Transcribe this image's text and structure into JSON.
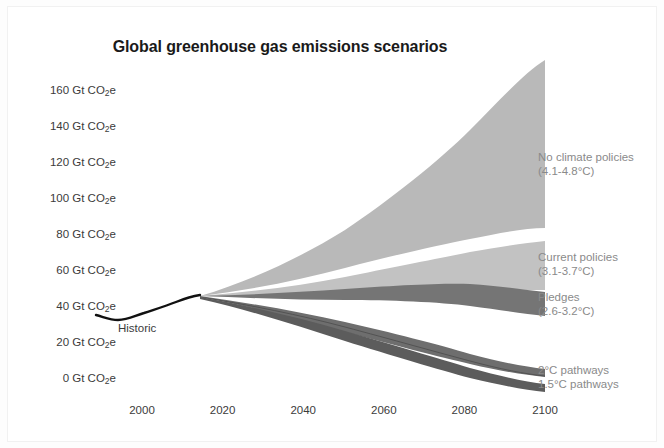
{
  "chart_data": {
    "type": "area",
    "title": "Global greenhouse gas emissions scenarios",
    "xlabel": "",
    "ylabel": "Gt CO2e",
    "xlim": [
      1990,
      2100
    ],
    "ylim": [
      -10,
      170
    ],
    "grid": false,
    "legend_position": "right-inline",
    "y_ticks": [
      {
        "value": 160,
        "label": "160 Gt CO",
        "sub": "2",
        "suffix": "e"
      },
      {
        "value": 140,
        "label": "140 Gt CO",
        "sub": "2",
        "suffix": "e"
      },
      {
        "value": 120,
        "label": "120 Gt CO",
        "sub": "2",
        "suffix": "e"
      },
      {
        "value": 100,
        "label": "100 Gt CO",
        "sub": "2",
        "suffix": "e"
      },
      {
        "value": 80,
        "label": "80 Gt CO",
        "sub": "2",
        "suffix": "e"
      },
      {
        "value": 60,
        "label": "60 Gt CO",
        "sub": "2",
        "suffix": "e"
      },
      {
        "value": 40,
        "label": "40 Gt CO",
        "sub": "2",
        "suffix": "e"
      },
      {
        "value": 20,
        "label": "20 Gt CO",
        "sub": "2",
        "suffix": "e"
      },
      {
        "value": 0,
        "label": "0 Gt CO",
        "sub": "2",
        "suffix": "e"
      }
    ],
    "x_ticks": [
      {
        "value": 2000,
        "label": "2000"
      },
      {
        "value": 2020,
        "label": "2020"
      },
      {
        "value": 2040,
        "label": "2040"
      },
      {
        "value": 2060,
        "label": "2060"
      },
      {
        "value": 2080,
        "label": "2080"
      },
      {
        "value": 2100,
        "label": "2100"
      }
    ],
    "historic": {
      "name": "Historic",
      "label": "Historic",
      "color": "#111111",
      "x": [
        1990,
        1994,
        1998,
        2002,
        2006,
        2010,
        2014,
        2018
      ],
      "values": [
        38,
        36.5,
        38,
        40,
        43,
        45,
        47,
        48
      ]
    },
    "series": [
      {
        "name": "No climate policies",
        "label": "No climate policies",
        "sublabel": "(4.1-4.8°C)",
        "color": "#b9b9b9",
        "x": [
          2018,
          2030,
          2040,
          2050,
          2060,
          2070,
          2080,
          2090,
          2100
        ],
        "upper": [
          48,
          62,
          76,
          92,
          108,
          122,
          138,
          152,
          166
        ],
        "lower": [
          48,
          54,
          59,
          64,
          68,
          72,
          75,
          78,
          80
        ]
      },
      {
        "name": "Current policies",
        "label": "Current policies",
        "sublabel": "(3.1-3.7°C)",
        "color": "#c2c2c2",
        "x": [
          2018,
          2030,
          2040,
          2050,
          2060,
          2070,
          2080,
          2090,
          2100
        ],
        "upper": [
          48,
          53,
          57,
          61,
          64,
          66,
          68,
          69,
          70
        ],
        "lower": [
          48,
          49,
          50,
          51,
          52,
          52,
          52,
          51,
          50
        ]
      },
      {
        "name": "Pledges",
        "label": "Pledges",
        "sublabel": "(2.6-3.2°C)",
        "color": "#757575",
        "x": [
          2018,
          2030,
          2040,
          2050,
          2060,
          2070,
          2080,
          2090,
          2100
        ],
        "upper": [
          48,
          50,
          52,
          54,
          55,
          55,
          53,
          51,
          49
        ],
        "lower": [
          48,
          46,
          45,
          45,
          45,
          44,
          42,
          39,
          36
        ]
      },
      {
        "name": "2°C pathways",
        "label": "2°C pathways",
        "sublabel": "",
        "color": "#6e6e6e",
        "x": [
          2018,
          2030,
          2040,
          2050,
          2060,
          2070,
          2080,
          2090,
          2100
        ],
        "upper": [
          48,
          42,
          36,
          29,
          23,
          18,
          14,
          11,
          9
        ],
        "lower": [
          48,
          38,
          31,
          24,
          18,
          13,
          9,
          7,
          5
        ]
      },
      {
        "name": "1.5°C pathways",
        "label": "1.5°C pathways",
        "sublabel": "",
        "color": "#5c5c5c",
        "x": [
          2018,
          2030,
          2040,
          2050,
          2060,
          2070,
          2080,
          2090,
          2100
        ],
        "upper": [
          48,
          37,
          29,
          21,
          14,
          9,
          5,
          2,
          0
        ],
        "lower": [
          48,
          34,
          25,
          17,
          10,
          5,
          1,
          -2,
          -4
        ]
      }
    ]
  },
  "labels": {
    "no_policies_l1": "No climate policies",
    "no_policies_l2": "(4.1-4.8°C)",
    "current_l1": "Current policies",
    "current_l2": "(3.1-3.7°C)",
    "pledges_l1": "Pledges",
    "pledges_l2": "(2.6-3.2°C)",
    "two_deg": "2°C pathways",
    "one_five_deg": "1.5°C pathways",
    "historic": "Historic"
  },
  "colors": {
    "background": "#ffffff",
    "page": "#fdfdfd",
    "no_policies": "#b9b9b9",
    "current_policies": "#c2c2c2",
    "pledges": "#757575",
    "two_deg": "#6e6e6e",
    "one_five_deg": "#5c5c5c",
    "historic_line": "#111111",
    "tick_text": "#3b3b3b",
    "scenario_text": "#8a8a8a",
    "title_text": "#1a1a1a"
  }
}
